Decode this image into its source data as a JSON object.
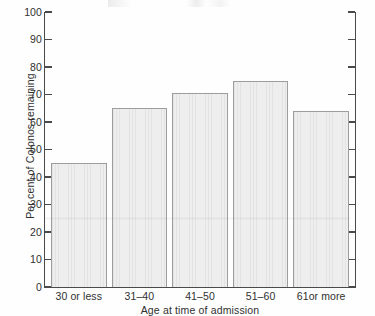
{
  "chart_data": {
    "type": "bar",
    "title": "",
    "subtitle": "",
    "xlabel": "Age at time of admission",
    "ylabel": "Per cent of Colonos remaining",
    "categories": [
      "30 or less",
      "31–40",
      "41–50",
      "51–60",
      "61or more"
    ],
    "values": [
      45,
      65,
      70.5,
      75,
      64
    ],
    "series": [
      {
        "name": "Per cent of Colonos remaining",
        "values": [
          45,
          65,
          70.5,
          75,
          64
        ]
      }
    ],
    "ylim": [
      0,
      100
    ],
    "ytick_labels": [
      "100",
      "90",
      "80",
      "70",
      "60",
      "50",
      "40",
      "30",
      "20",
      "10",
      "0"
    ],
    "ytick_values": [
      100,
      90,
      80,
      70,
      60,
      50,
      40,
      30,
      20,
      10,
      0
    ],
    "ytick_interval": 10,
    "grid": false,
    "legend": false,
    "legend_position": "none",
    "right_axis_ticks": true,
    "right_axis_labeled": false,
    "bar_fill_color": "#eeeeee",
    "bar_edge_color": "#9d9d9d",
    "axis_color": "#4a4a4a",
    "background_color": "#fefefe",
    "annotations": []
  }
}
